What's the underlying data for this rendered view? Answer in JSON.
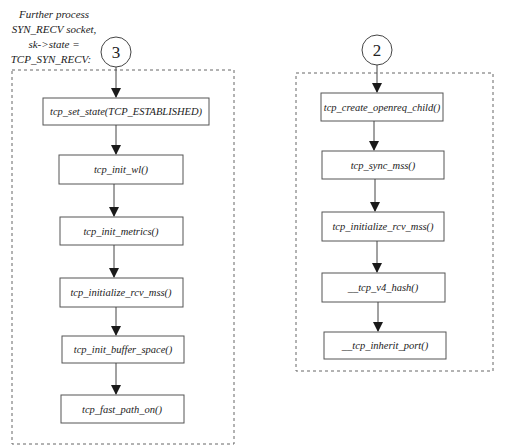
{
  "diagram": {
    "caption_left": [
      "Further process",
      "SYN_RECV socket,",
      "sk->state =",
      "TCP_SYN_RECV:"
    ],
    "groups": [
      {
        "id": "group-3",
        "label": "3",
        "nodes": [
          "tcp_set_state(TCP_ESTABLISHED)",
          "tcp_init_wl()",
          "tcp_init_metrics()",
          "tcp_initialize_rcv_mss()",
          "tcp_init_buffer_space()",
          "tcp_fast_path_on()"
        ]
      },
      {
        "id": "group-2",
        "label": "2",
        "nodes": [
          "tcp_create_openreq_child()",
          "tcp_sync_mss()",
          "tcp_initialize_rcv_mss()",
          "__tcp_v4_hash()",
          "__tcp_inherit_port()"
        ]
      }
    ],
    "edges": [
      {
        "from": "3",
        "to": "tcp_set_state(TCP_ESTABLISHED)"
      },
      {
        "from": "tcp_set_state(TCP_ESTABLISHED)",
        "to": "tcp_init_wl()"
      },
      {
        "from": "tcp_init_wl()",
        "to": "tcp_init_metrics()"
      },
      {
        "from": "tcp_init_metrics()",
        "to": "tcp_initialize_rcv_mss()"
      },
      {
        "from": "tcp_initialize_rcv_mss()",
        "to": "tcp_init_buffer_space()"
      },
      {
        "from": "tcp_init_buffer_space()",
        "to": "tcp_fast_path_on()"
      },
      {
        "from": "2",
        "to": "tcp_create_openreq_child()"
      },
      {
        "from": "tcp_create_openreq_child()",
        "to": "tcp_sync_mss()"
      },
      {
        "from": "tcp_sync_mss()",
        "to": "tcp_initialize_rcv_mss()"
      },
      {
        "from": "tcp_initialize_rcv_mss()",
        "to": "__tcp_v4_hash()"
      },
      {
        "from": "__tcp_v4_hash()",
        "to": "__tcp_inherit_port()"
      }
    ]
  }
}
